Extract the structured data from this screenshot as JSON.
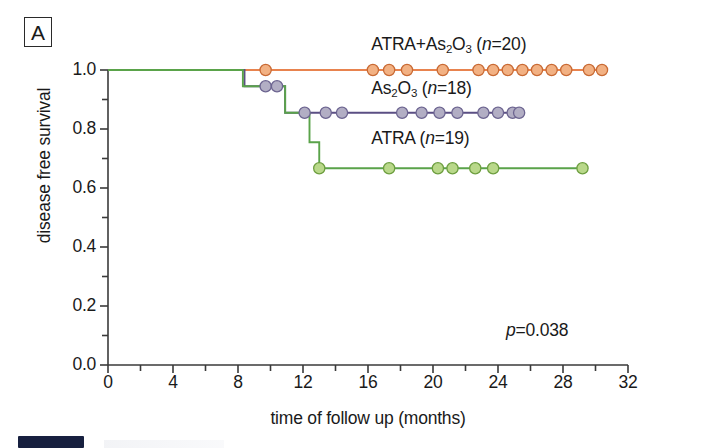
{
  "panel": {
    "label": "A"
  },
  "chart_data": {
    "type": "line",
    "subtype": "kaplan-meier-step",
    "title": "",
    "xlabel": "time of follow up (months)",
    "ylabel": "disease free survival",
    "xlim": [
      0,
      32
    ],
    "ylim": [
      0.0,
      1.0
    ],
    "xticks": [
      0,
      4,
      8,
      12,
      16,
      20,
      24,
      28,
      32
    ],
    "xtick_labels": [
      "0",
      "4",
      "8",
      "12",
      "16",
      "20",
      "24",
      "28",
      "32"
    ],
    "xminor_step": 2,
    "yticks": [
      0.0,
      0.2,
      0.4,
      0.6,
      0.8,
      1.0
    ],
    "ytick_labels": [
      "0.0",
      "0.2",
      "0.4",
      "0.6",
      "0.8",
      "1.0"
    ],
    "yminor_step": 0.1,
    "grid": false,
    "legend_position": "inline-above-curves",
    "annotations": [
      {
        "name": "p-value",
        "text": "p=0.038",
        "x": 24.5,
        "y": 0.16
      }
    ],
    "series": [
      {
        "name": "ATRA+As2O3",
        "label": "ATRA+As₂O₃ (n=20)",
        "n": 20,
        "color": "#e8834e",
        "marker_fill": "#f2b183",
        "marker_edge": "#c96a34",
        "label_x": 16.2,
        "label_y": 1.085,
        "steps": [
          {
            "time": 0,
            "survival": 1.0
          },
          {
            "time": 30.5,
            "survival": 1.0
          }
        ],
        "censor_points": [
          {
            "time": 9.7,
            "survival": 1.0
          },
          {
            "time": 16.3,
            "survival": 1.0
          },
          {
            "time": 17.3,
            "survival": 1.0
          },
          {
            "time": 18.4,
            "survival": 1.0
          },
          {
            "time": 20.6,
            "survival": 1.0
          },
          {
            "time": 22.8,
            "survival": 1.0
          },
          {
            "time": 23.7,
            "survival": 1.0
          },
          {
            "time": 24.6,
            "survival": 1.0
          },
          {
            "time": 25.5,
            "survival": 1.0
          },
          {
            "time": 26.4,
            "survival": 1.0
          },
          {
            "time": 27.3,
            "survival": 1.0
          },
          {
            "time": 28.2,
            "survival": 1.0
          },
          {
            "time": 29.6,
            "survival": 1.0
          },
          {
            "time": 30.4,
            "survival": 1.0
          }
        ]
      },
      {
        "name": "As2O3",
        "label": "As₂O₃ (n=18)",
        "n": 18,
        "color": "#5b4f84",
        "marker_fill": "#b2aec4",
        "marker_edge": "#6c6490",
        "label_x": 16.2,
        "label_y": 0.935,
        "steps": [
          {
            "time": 0,
            "survival": 1.0
          },
          {
            "time": 8.4,
            "survival": 1.0
          },
          {
            "time": 8.4,
            "survival": 0.945
          },
          {
            "time": 10.9,
            "survival": 0.945
          },
          {
            "time": 10.9,
            "survival": 0.855
          },
          {
            "time": 25.3,
            "survival": 0.855
          }
        ],
        "censor_points": [
          {
            "time": 9.7,
            "survival": 0.945
          },
          {
            "time": 10.4,
            "survival": 0.945
          },
          {
            "time": 12.1,
            "survival": 0.855
          },
          {
            "time": 13.4,
            "survival": 0.855
          },
          {
            "time": 14.4,
            "survival": 0.855
          },
          {
            "time": 18.1,
            "survival": 0.855
          },
          {
            "time": 19.3,
            "survival": 0.855
          },
          {
            "time": 20.4,
            "survival": 0.855
          },
          {
            "time": 21.5,
            "survival": 0.855
          },
          {
            "time": 23.1,
            "survival": 0.855
          },
          {
            "time": 24.0,
            "survival": 0.855
          },
          {
            "time": 24.9,
            "survival": 0.855
          },
          {
            "time": 25.3,
            "survival": 0.855
          }
        ]
      },
      {
        "name": "ATRA",
        "label": "ATRA (n=19)",
        "n": 19,
        "color": "#5aa34a",
        "marker_fill": "#b9d88a",
        "marker_edge": "#6d9e3f",
        "label_x": 16.2,
        "label_y": 0.765,
        "steps": [
          {
            "time": 0,
            "survival": 1.0
          },
          {
            "time": 8.3,
            "survival": 1.0
          },
          {
            "time": 8.3,
            "survival": 0.945
          },
          {
            "time": 10.9,
            "survival": 0.945
          },
          {
            "time": 10.9,
            "survival": 0.855
          },
          {
            "time": 12.4,
            "survival": 0.855
          },
          {
            "time": 12.4,
            "survival": 0.755
          },
          {
            "time": 13.0,
            "survival": 0.755
          },
          {
            "time": 13.0,
            "survival": 0.667
          },
          {
            "time": 29.2,
            "survival": 0.667
          }
        ],
        "censor_points": [
          {
            "time": 13.0,
            "survival": 0.667
          },
          {
            "time": 17.3,
            "survival": 0.667
          },
          {
            "time": 20.3,
            "survival": 0.667
          },
          {
            "time": 21.2,
            "survival": 0.667
          },
          {
            "time": 22.6,
            "survival": 0.667
          },
          {
            "time": 23.7,
            "survival": 0.667
          },
          {
            "time": 29.2,
            "survival": 0.667
          }
        ]
      }
    ]
  }
}
